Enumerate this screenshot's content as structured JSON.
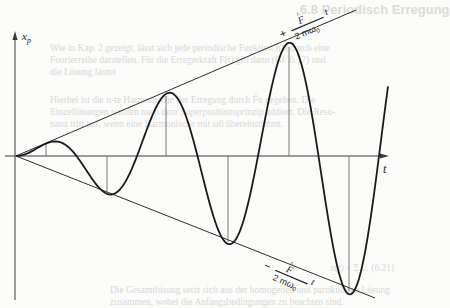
{
  "figure": {
    "y_axis_label": "x",
    "y_axis_subscript": "p",
    "x_axis_label": "t",
    "upper_envelope_label": {
      "sign": "+",
      "numerator": "F",
      "numerator_hat": "^",
      "denominator": "2 mω",
      "denominator_subscript": "0",
      "variable": "t"
    },
    "lower_envelope_label": {
      "sign": "−",
      "numerator": "F",
      "numerator_hat": "^",
      "denominator": "2 mω",
      "denominator_subscript": "0",
      "variable": "t"
    },
    "colors": {
      "curve": "#1a1a1a",
      "axis": "#3a3a3a",
      "envelope": "#2e2e2e",
      "guide": "#6a6a6a",
      "background": "#fbfbfa",
      "showthrough": "#d9d9d6"
    }
  },
  "chart_data": {
    "type": "line",
    "title": "",
    "xlabel": "t",
    "ylabel": "x_p",
    "function": "x_p(t) = (F̂ / (2 m ω0)) · t · sin(ω0 t)",
    "envelopes": [
      "+ (F̂ / 2mω0) t",
      "− (F̂ / 2mω0) t"
    ],
    "origin_px": [
      16,
      156
    ],
    "period_px": 121,
    "envelope_slope_px": 0.415,
    "t_end_px": 372,
    "extrema_px": [
      {
        "x": 46,
        "y": 143,
        "kind": "max"
      },
      {
        "x": 107,
        "y": 193,
        "kind": "min"
      },
      {
        "x": 166,
        "y": 96,
        "kind": "max"
      },
      {
        "x": 228,
        "y": 242,
        "kind": "min"
      },
      {
        "x": 289,
        "y": 47,
        "kind": "max"
      },
      {
        "x": 349,
        "y": 291,
        "kind": "min"
      }
    ],
    "grid": false,
    "legend": null
  },
  "showthrough_text": {
    "heading": "6.8 Periodisch Erregung",
    "lines": [
      "Wie in Kap. 2 gezeigt, lässt sich jede periodische Funktion f(t) durch eine",
      "Fourierreihe darstellen. Für die Erregerkraft F(t) gilt dann (Gl. 6.17) und",
      "die Lösung lautet",
      "Hierbei ist die n-te Harmonische der Erregung durch F̂n gegeben. Die",
      "Einzellösungen werden nach dem Superpositionsprinzip addiert. Die Reso-",
      "nanz tritt auf, wenn eine Harmonische mit ω0 übereinstimmt.",
      "x(t) = Σ ... (6.21)",
      "Die Gesamtlösung setzt sich aus der homogenen und partikulären Lösung",
      "zusammen, wobei die Anfangsbedingungen zu beachten sind."
    ]
  }
}
